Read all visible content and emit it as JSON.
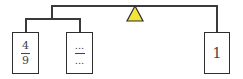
{
  "diagram": {
    "type": "balance-scale-tree",
    "fulcrum": {
      "shape": "triangle",
      "color": "#f2e43a"
    },
    "left_group": {
      "boxes": [
        {
          "numerator": "4",
          "denominator": "9"
        },
        {
          "numerator": "...",
          "denominator": "..."
        }
      ]
    },
    "right_group": {
      "boxes": [
        {
          "value": "1"
        }
      ]
    }
  }
}
